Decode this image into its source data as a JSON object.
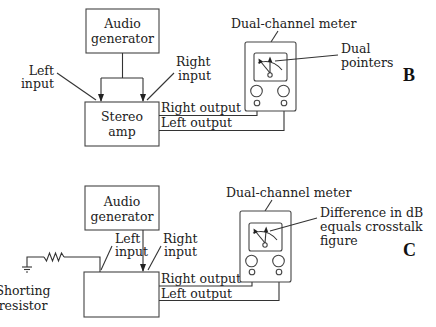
{
  "panels": [
    {
      "id": "B",
      "label": "B",
      "generator": {
        "line1": "Audio",
        "line2": "generator"
      },
      "amp": {
        "line1": "Stereo",
        "line2": "amp"
      },
      "left_input": {
        "line1": "Left",
        "line2": "input"
      },
      "right_input": {
        "line1": "Right",
        "line2": "input"
      },
      "right_output": "Right output",
      "left_output": "Left output",
      "meter_title": "Dual-channel meter",
      "meter_note": {
        "line1": "Dual",
        "line2": "pointers"
      }
    },
    {
      "id": "C",
      "label": "C",
      "generator": {
        "line1": "Audio",
        "line2": "generator"
      },
      "amp": {
        "line1": "",
        "line2": ""
      },
      "left_input": {
        "line1": "Left",
        "line2": "input"
      },
      "right_input": {
        "line1": "Right",
        "line2": "input"
      },
      "right_output": "Right output",
      "left_output": "Left output",
      "meter_title": "Dual-channel meter",
      "meter_note": {
        "line1": "Difference in dB",
        "line2": "equals crosstalk",
        "line3": "figure"
      },
      "resistor": {
        "line1": "Shorting",
        "line2": "resistor"
      }
    }
  ],
  "colors": {
    "line": "#333333",
    "text": "#222222",
    "background": "#ffffff"
  }
}
